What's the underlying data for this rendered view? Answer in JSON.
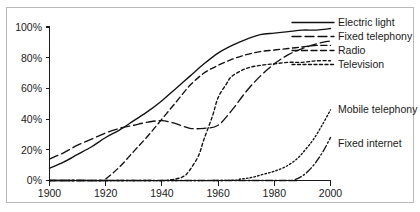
{
  "chart_data": {
    "type": "line",
    "title": "",
    "subtitle": "",
    "xlabel": "",
    "ylabel": "",
    "xlim": [
      1900,
      2000
    ],
    "ylim": [
      0,
      100
    ],
    "grid": false,
    "legend_position": "right",
    "x_ticks": [
      "1900",
      "1920",
      "1940",
      "1960",
      "1980",
      "2000"
    ],
    "x_tick_values": [
      1900,
      1920,
      1940,
      1960,
      1980,
      2000
    ],
    "y_ticks": [
      "0%",
      "20%",
      "40%",
      "60%",
      "80%",
      "100%"
    ],
    "y_tick_values": [
      0,
      20,
      40,
      60,
      80,
      100
    ],
    "series": [
      {
        "name": "Electric light",
        "style": "solid",
        "dasharray": "none",
        "label_y": 26,
        "x": [
          1900,
          1905,
          1910,
          1915,
          1920,
          1925,
          1930,
          1935,
          1940,
          1945,
          1950,
          1955,
          1960,
          1965,
          1970,
          1975,
          1980,
          1985,
          1990,
          1995,
          2000
        ],
        "values": [
          8,
          12,
          17,
          22,
          28,
          33,
          39,
          45,
          52,
          60,
          68,
          76,
          83,
          88,
          92,
          95,
          96,
          97,
          98,
          98,
          99
        ]
      },
      {
        "name": "Fixed telephony",
        "style": "long-dash",
        "dasharray": "9,4",
        "label_y": 40,
        "x": [
          1900,
          1905,
          1910,
          1915,
          1920,
          1925,
          1930,
          1935,
          1940,
          1945,
          1950,
          1955,
          1960,
          1965,
          1970,
          1975,
          1980,
          1985,
          1990,
          1995,
          2000
        ],
        "values": [
          14,
          18,
          23,
          27,
          31,
          34,
          36,
          38,
          39,
          37,
          34,
          34,
          36,
          46,
          58,
          68,
          76,
          82,
          86,
          89,
          91
        ]
      },
      {
        "name": "Radio",
        "style": "medium-dash",
        "dasharray": "6,3.5",
        "label_y": 54,
        "x": [
          1900,
          1910,
          1918,
          1920,
          1925,
          1930,
          1935,
          1940,
          1945,
          1950,
          1955,
          1960,
          1965,
          1970,
          1975,
          1980,
          1985,
          1990,
          1995,
          2000
        ],
        "values": [
          0,
          0,
          0,
          1,
          9,
          19,
          29,
          40,
          51,
          62,
          70,
          75,
          79,
          82,
          84,
          85,
          86,
          87,
          88,
          88
        ]
      },
      {
        "name": "Television",
        "style": "dotted-dash",
        "dasharray": "3,2.5",
        "label_y": 68,
        "x": [
          1900,
          1920,
          1930,
          1935,
          1940,
          1945,
          1948,
          1950,
          1953,
          1955,
          1958,
          1960,
          1963,
          1965,
          1970,
          1975,
          1980,
          1985,
          1990,
          1995,
          2000
        ],
        "values": [
          0,
          0,
          0,
          0,
          0,
          1,
          3,
          7,
          16,
          27,
          42,
          54,
          63,
          68,
          73,
          75,
          76,
          77,
          77,
          78,
          78
        ]
      },
      {
        "name": "Mobile telephony",
        "style": "fine-dotted",
        "dasharray": "1.6,2.2",
        "label_y": 113,
        "x": [
          1900,
          1960,
          1968,
          1972,
          1976,
          1980,
          1984,
          1988,
          1991,
          1994,
          1997,
          2000
        ],
        "values": [
          0,
          0,
          1,
          2,
          4,
          6,
          9,
          14,
          20,
          27,
          36,
          46
        ]
      },
      {
        "name": "Fixed internet",
        "style": "dash-dot",
        "dasharray": "7,2.5,1.5,2.5",
        "label_y": 147,
        "x": [
          1900,
          1980,
          1986,
          1988,
          1990,
          1992,
          1994,
          1996,
          1998,
          2000
        ],
        "values": [
          0,
          0,
          0,
          1,
          3,
          6,
          10,
          15,
          21,
          28
        ]
      }
    ]
  },
  "legend": {
    "items": [
      {
        "label": "Electric light"
      },
      {
        "label": "Fixed telephony"
      },
      {
        "label": "Radio"
      },
      {
        "label": "Television"
      },
      {
        "label": "Mobile telephony"
      },
      {
        "label": "Fixed internet"
      }
    ]
  },
  "colors": {
    "ink": "#111111",
    "axis": "#1a1a1a",
    "frame": "#b9b9b9",
    "background": "#ffffff"
  }
}
